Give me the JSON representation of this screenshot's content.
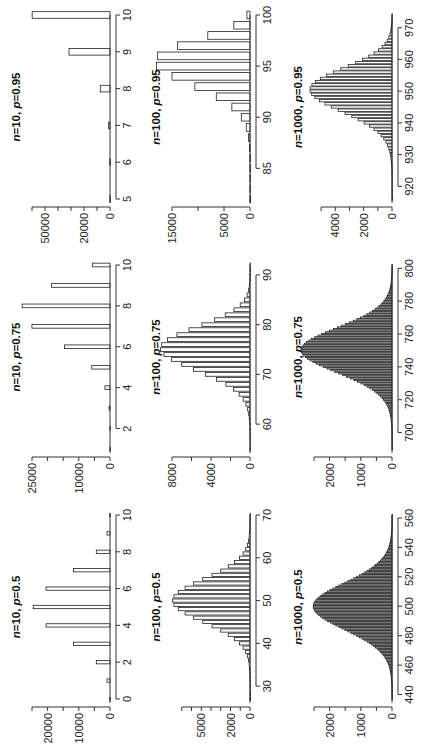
{
  "figure": {
    "rotation": "rotated 90 degrees counter-clockwise on the page",
    "trials": 100000
  },
  "chart_data": [
    {
      "type": "bar",
      "title": "n=10, p=0.5",
      "title_n": "n",
      "title_n_val": "=10, ",
      "title_p": "p",
      "title_p_val": "=0.5",
      "n": 10,
      "p": 0.5,
      "xlim": [
        0,
        10
      ],
      "ylim": [
        0,
        25000
      ],
      "xticks": [
        0,
        2,
        4,
        6,
        8,
        10
      ],
      "yticks": [
        0,
        10000,
        20000
      ],
      "yminor": [
        5000,
        15000,
        25000
      ],
      "categories": [
        0,
        1,
        2,
        3,
        4,
        5,
        6,
        7,
        8,
        9,
        10
      ],
      "values": [
        98,
        977,
        4395,
        11719,
        20508,
        24609,
        20508,
        11719,
        4395,
        977,
        98
      ],
      "row": 0,
      "col": 0
    },
    {
      "type": "bar",
      "title": "n=10, p=0.75",
      "title_n": "n",
      "title_n_val": "=10, ",
      "title_p": "p",
      "title_p_val": "=0.75",
      "n": 10,
      "p": 0.75,
      "xlim": [
        1,
        10
      ],
      "ylim": [
        0,
        25000
      ],
      "xticks": [
        2,
        4,
        6,
        8,
        10
      ],
      "yticks": [
        0,
        10000,
        25000
      ],
      "yminor": [
        5000,
        15000,
        20000
      ],
      "categories": [
        1,
        2,
        3,
        4,
        5,
        6,
        7,
        8,
        9,
        10
      ],
      "values": [
        3,
        39,
        309,
        1622,
        5840,
        14600,
        25028,
        28157,
        18771,
        5631
      ],
      "row": 0,
      "col": 1
    },
    {
      "type": "bar",
      "title": "n=10, p=0.95",
      "title_n": "n",
      "title_n_val": "=10, ",
      "title_p": "p",
      "title_p_val": "=0.95",
      "n": 10,
      "p": 0.95,
      "xlim": [
        5,
        10
      ],
      "ylim": [
        0,
        60000
      ],
      "xticks": [
        5,
        6,
        7,
        8,
        9,
        10
      ],
      "yticks": [
        0,
        20000,
        50000
      ],
      "yminor": [
        10000,
        30000,
        40000,
        60000
      ],
      "categories": [
        5,
        6,
        7,
        8,
        9,
        10
      ],
      "values": [
        6,
        96,
        1048,
        7463,
        31512,
        59874
      ],
      "row": 0,
      "col": 2
    },
    {
      "type": "bar",
      "title": "n=100, p=0.5",
      "title_n": "n",
      "title_n_val": "=100, ",
      "title_p": "p",
      "title_p_val": "=0.5",
      "n": 100,
      "p": 0.5,
      "xlim": [
        27,
        70
      ],
      "ylim": [
        0,
        8000
      ],
      "xticks": [
        30,
        40,
        50,
        60,
        70
      ],
      "yticks": [
        0,
        2000,
        5000
      ],
      "yminor": [
        1000,
        3000,
        4000,
        6000,
        7000
      ],
      "categories": "integers 33..67 (binomial pmf x trials)",
      "row": 1,
      "col": 0
    },
    {
      "type": "bar",
      "title": "n=100, p=0.75",
      "title_n": "n",
      "title_n_val": "=100, ",
      "title_p": "p",
      "title_p_val": "=0.75",
      "n": 100,
      "p": 0.75,
      "xlim": [
        55,
        92
      ],
      "ylim": [
        0,
        8000
      ],
      "xticks": [
        60,
        70,
        80,
        90
      ],
      "yticks": [
        0,
        4000,
        8000
      ],
      "yminor": [
        2000,
        6000
      ],
      "categories": "integers 59..90 (binomial pmf x trials)",
      "row": 1,
      "col": 1
    },
    {
      "type": "bar",
      "title": "n=100, p=0.95",
      "title_n": "n",
      "title_n_val": "=100, ",
      "title_p": "p",
      "title_p_val": "=0.95",
      "n": 100,
      "p": 0.95,
      "xlim": [
        82,
        100
      ],
      "ylim": [
        0,
        15000
      ],
      "xticks": [
        85,
        90,
        95,
        100
      ],
      "yticks": [
        0,
        5000,
        15000
      ],
      "yminor": [
        10000
      ],
      "categories": "integers 82..100 (binomial pmf x trials)",
      "row": 1,
      "col": 2
    },
    {
      "type": "bar",
      "title": "n=1000, p=0.5",
      "title_n": "n",
      "title_n_val": "=1000, ",
      "title_p": "p",
      "title_p_val": "=0.5",
      "n": 1000,
      "p": 0.5,
      "xlim": [
        437,
        562
      ],
      "ylim": [
        0,
        2500
      ],
      "xticks": [
        440,
        460,
        480,
        500,
        520,
        540,
        560
      ],
      "yticks": [
        0,
        1000,
        2000
      ],
      "yminor": [
        500,
        1500,
        2500
      ],
      "categories": "integers 440..560 (binomial pmf x trials)",
      "row": 2,
      "col": 0
    },
    {
      "type": "bar",
      "title": "n=1000, p=0.75",
      "title_n": "n",
      "title_n_val": "=1000, ",
      "title_p": "p",
      "title_p_val": "=0.75",
      "n": 1000,
      "p": 0.75,
      "xlim": [
        690,
        802
      ],
      "ylim": [
        0,
        2500
      ],
      "xticks": [
        700,
        720,
        740,
        760,
        780,
        800
      ],
      "yticks": [
        0,
        1000,
        2000
      ],
      "yminor": [
        500,
        1500,
        2500
      ],
      "categories": "integers 690..800 (binomial pmf x trials)",
      "row": 2,
      "col": 1
    },
    {
      "type": "bar",
      "title": "n=1000, p=0.95",
      "title_n": "n",
      "title_n_val": "=1000, ",
      "title_p": "p",
      "title_p_val": "=0.95",
      "n": 1000,
      "p": 0.95,
      "xlim": [
        916,
        974
      ],
      "ylim": [
        0,
        5500
      ],
      "xticks": [
        920,
        930,
        940,
        950,
        960,
        970
      ],
      "yticks": [
        0,
        2000,
        4000
      ],
      "yminor": [
        1000,
        3000,
        5000
      ],
      "categories": "integers 918..974 (binomial pmf x trials)",
      "row": 2,
      "col": 2
    }
  ]
}
